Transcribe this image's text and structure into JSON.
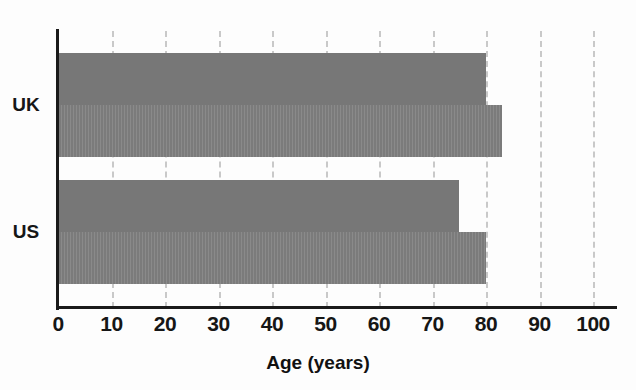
{
  "chart_data": {
    "type": "bar",
    "orientation": "horizontal",
    "title": "",
    "xlabel": "Age (years)",
    "ylabel": "",
    "categories": [
      "UK",
      "US"
    ],
    "series": [
      {
        "name": "series-1",
        "values": [
          80,
          75
        ]
      },
      {
        "name": "series-2",
        "values": [
          83,
          80
        ]
      }
    ],
    "xlim": [
      0,
      100
    ],
    "xticks": [
      0,
      10,
      20,
      30,
      40,
      50,
      60,
      70,
      80,
      90,
      100
    ],
    "xtick_labels": [
      "0",
      "10",
      "20",
      "30",
      "40",
      "50",
      "60",
      "70",
      "80",
      "90",
      "100"
    ],
    "grid": true,
    "grid_axis": "x",
    "grid_style": "dashed",
    "legend": "none",
    "colors": {
      "bar_series_1": "#777777",
      "bar_series_2": "#7d7d7d",
      "axis": "#1a1a1a",
      "gridline": "#c9c9c9",
      "background": "#fdfdfd",
      "text": "#161616"
    }
  },
  "axis": {
    "x_title": "Age (years)",
    "ticks": [
      {
        "label": "0",
        "value": 0
      },
      {
        "label": "10",
        "value": 10
      },
      {
        "label": "20",
        "value": 20
      },
      {
        "label": "30",
        "value": 30
      },
      {
        "label": "40",
        "value": 40
      },
      {
        "label": "50",
        "value": 50
      },
      {
        "label": "60",
        "value": 60
      },
      {
        "label": "70",
        "value": 70
      },
      {
        "label": "80",
        "value": 80
      },
      {
        "label": "90",
        "value": 90
      },
      {
        "label": "100",
        "value": 100
      }
    ]
  },
  "groups": [
    {
      "label": "UK",
      "bars": [
        {
          "value": 80,
          "shade": "a"
        },
        {
          "value": 83,
          "shade": "b"
        }
      ]
    },
    {
      "label": "US",
      "bars": [
        {
          "value": 75,
          "shade": "a"
        },
        {
          "value": 80,
          "shade": "b"
        }
      ]
    }
  ]
}
